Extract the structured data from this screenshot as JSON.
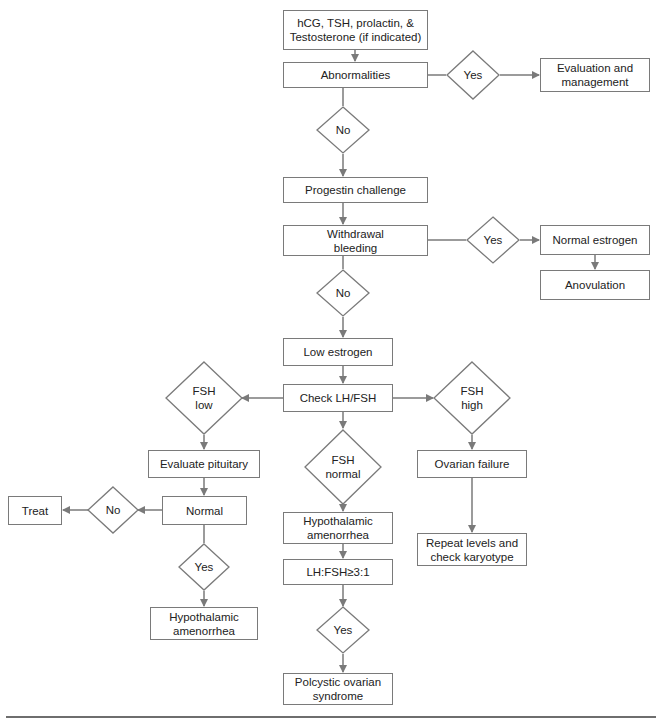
{
  "colors": {
    "stroke": "#7a7a7a",
    "text": "#222222",
    "background": "#ffffff"
  },
  "nodes": {
    "tests": "hCG, TSH, prolactin, &\nTestosterone (if indicated)",
    "abnormalities": "Abnormalities",
    "eval_mgmt": "Evaluation and\nmanagement",
    "progestin": "Progestin challenge",
    "withdrawal": "Withdrawal\nbleeding",
    "normal_estrogen": "Normal estrogen",
    "anovulation": "Anovulation",
    "low_estrogen": "Low estrogen",
    "check_lhfsh": "Check LH/FSH",
    "eval_pituitary": "Evaluate pituitary",
    "normal": "Normal",
    "treat": "Treat",
    "hypo_left": "Hypothalamic\namenorrhea",
    "hypo_center": "Hypothalamic\namenorrhea",
    "lh_ratio": "LH:FSH≥3:1",
    "pcos": "Polcystic ovarian\nsyndrome",
    "ovarian_failure": "Ovarian failure",
    "repeat": "Repeat levels and\ncheck karyotype"
  },
  "decisions": {
    "yes_abn": "Yes",
    "no_abn": "No",
    "yes_withdrawal": "Yes",
    "no_withdrawal": "No",
    "fsh_low": "FSH\nlow",
    "fsh_high": "FSH\nhigh",
    "fsh_normal": "FSH\nnormal",
    "no_normal": "No",
    "yes_normal": "Yes",
    "yes_ratio": "Yes"
  }
}
